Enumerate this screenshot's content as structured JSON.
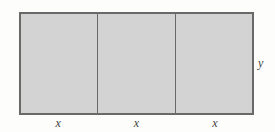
{
  "diagram": {
    "fill_color": "#d3d3d3",
    "border_color": "#696969",
    "text_color": "#3d3d3d",
    "sections": [
      {
        "label": "x"
      },
      {
        "label": "x"
      },
      {
        "label": "x"
      }
    ],
    "side_label": "y"
  }
}
